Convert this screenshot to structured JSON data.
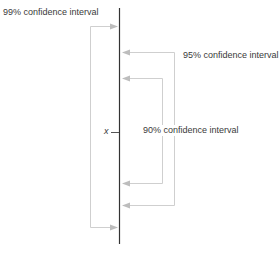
{
  "diagram": {
    "title": "",
    "center_label": "x",
    "intervals": [
      {
        "name": "99% confidence interval",
        "level": 99
      },
      {
        "name": "95% confidence interval",
        "level": 95
      },
      {
        "name": "90% confidence interval",
        "level": 90
      }
    ],
    "colors": {
      "axis": "#333333",
      "bracket": "#c8c8c8",
      "arrow": "#bdbdbd",
      "text": "#3a3a3a"
    }
  }
}
